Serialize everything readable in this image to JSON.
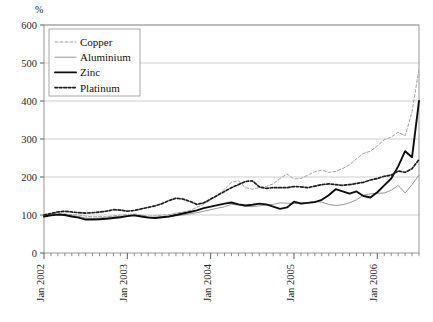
{
  "figure": {
    "partial_title": "",
    "y_axis_unit": "%",
    "background": "#ffffff",
    "grid_color": "#b9b9b9",
    "frame_color": "#8c8c8c"
  },
  "legend": {
    "position": "top-left",
    "entries": [
      {
        "label": "Copper",
        "style": "dashed-thin",
        "color": "#9a9a9a"
      },
      {
        "label": "Aluminium",
        "style": "solid-thin",
        "color": "#8a8a8a"
      },
      {
        "label": "Zinc",
        "style": "solid-thick",
        "color": "#111111"
      },
      {
        "label": "Platinum",
        "style": "dotted-thick",
        "color": "#222222"
      }
    ]
  },
  "chart_data": {
    "type": "line",
    "title": "",
    "xlabel": "",
    "ylabel": "%",
    "ylim": [
      0,
      600
    ],
    "yticks": [
      0,
      100,
      200,
      300,
      400,
      500,
      600
    ],
    "grid": true,
    "legend_position": "top-left",
    "x_tick_labels": [
      "Jan 2002",
      "Jan 2003",
      "Jan 2004",
      "Jan 2005",
      "Jan 2006"
    ],
    "x_tick_indices": [
      0,
      12,
      24,
      36,
      48
    ],
    "x_minor_tick_interval_months": 1,
    "x": [
      "Jan 2002",
      "Feb 2002",
      "Mar 2002",
      "Apr 2002",
      "May 2002",
      "Jun 2002",
      "Jul 2002",
      "Aug 2002",
      "Sep 2002",
      "Oct 2002",
      "Nov 2002",
      "Dec 2002",
      "Jan 2003",
      "Feb 2003",
      "Mar 2003",
      "Apr 2003",
      "May 2003",
      "Jun 2003",
      "Jul 2003",
      "Aug 2003",
      "Sep 2003",
      "Oct 2003",
      "Nov 2003",
      "Dec 2003",
      "Jan 2004",
      "Feb 2004",
      "Mar 2004",
      "Apr 2004",
      "May 2004",
      "Jun 2004",
      "Jul 2004",
      "Aug 2004",
      "Sep 2004",
      "Oct 2004",
      "Nov 2004",
      "Dec 2004",
      "Jan 2005",
      "Feb 2005",
      "Mar 2005",
      "Apr 2005",
      "May 2005",
      "Jun 2005",
      "Jul 2005",
      "Aug 2005",
      "Sep 2005",
      "Oct 2005",
      "Nov 2005",
      "Dec 2005",
      "Jan 2006",
      "Feb 2006",
      "Mar 2006",
      "Apr 2006",
      "May 2006",
      "Jun 2006",
      "Jul 2006"
    ],
    "series": [
      {
        "name": "Copper",
        "values": [
          98,
          101,
          104,
          103,
          101,
          100,
          97,
          95,
          96,
          95,
          98,
          100,
          101,
          103,
          100,
          97,
          98,
          100,
          101,
          105,
          108,
          112,
          120,
          128,
          140,
          152,
          168,
          186,
          190,
          172,
          168,
          172,
          175,
          182,
          196,
          208,
          195,
          196,
          205,
          214,
          218,
          212,
          215,
          222,
          232,
          248,
          262,
          268,
          282,
          298,
          305,
          318,
          308,
          372,
          485
        ]
      },
      {
        "name": "Aluminium",
        "values": [
          99,
          100,
          102,
          101,
          98,
          96,
          92,
          91,
          92,
          94,
          95,
          96,
          98,
          100,
          98,
          95,
          94,
          95,
          96,
          98,
          100,
          103,
          106,
          110,
          114,
          118,
          122,
          128,
          126,
          123,
          122,
          124,
          126,
          128,
          132,
          131,
          130,
          132,
          133,
          136,
          134,
          128,
          125,
          127,
          132,
          140,
          152,
          156,
          157,
          158,
          165,
          178,
          158,
          180,
          205
        ]
      },
      {
        "name": "Zinc",
        "values": [
          96,
          99,
          101,
          100,
          96,
          93,
          88,
          88,
          89,
          90,
          92,
          94,
          97,
          99,
          96,
          93,
          92,
          94,
          96,
          100,
          104,
          108,
          112,
          118,
          122,
          126,
          130,
          133,
          128,
          125,
          127,
          130,
          128,
          122,
          116,
          120,
          135,
          130,
          132,
          134,
          140,
          152,
          168,
          162,
          156,
          162,
          150,
          146,
          160,
          178,
          196,
          228,
          268,
          252,
          400
        ]
      },
      {
        "name": "Platinum",
        "values": [
          100,
          104,
          108,
          110,
          108,
          106,
          105,
          106,
          108,
          110,
          114,
          113,
          110,
          112,
          116,
          120,
          124,
          130,
          138,
          144,
          142,
          136,
          128,
          132,
          142,
          152,
          162,
          172,
          180,
          188,
          190,
          174,
          170,
          172,
          172,
          172,
          175,
          174,
          172,
          176,
          180,
          182,
          180,
          178,
          180,
          183,
          186,
          192,
          196,
          202,
          205,
          216,
          212,
          222,
          246
        ]
      }
    ]
  }
}
